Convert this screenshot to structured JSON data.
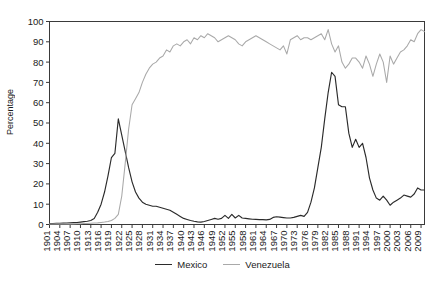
{
  "chart_data": {
    "type": "line",
    "title": "",
    "xlabel": "",
    "ylabel": "Percentage",
    "ylim": [
      0,
      100
    ],
    "yticks": [
      0,
      10,
      20,
      30,
      40,
      50,
      60,
      70,
      80,
      90,
      100
    ],
    "xlim": [
      1901,
      2010
    ],
    "xtick_labels": [
      "1901",
      "1904",
      "1907",
      "1910",
      "1913",
      "1916",
      "1919",
      "1922",
      "1925",
      "1928",
      "1931",
      "1934",
      "1937",
      "1940",
      "1943",
      "1946",
      "1949",
      "1952",
      "1955",
      "1958",
      "1961",
      "1964",
      "1967",
      "1970",
      "1973",
      "1976",
      "1979",
      "1982",
      "1985",
      "1988",
      "1991",
      "1994",
      "1997",
      "2000",
      "2003",
      "2006",
      "2009"
    ],
    "grid": false,
    "legend_position": "bottom-center",
    "x": [
      1901,
      1902,
      1903,
      1904,
      1905,
      1906,
      1907,
      1908,
      1909,
      1910,
      1911,
      1912,
      1913,
      1914,
      1915,
      1916,
      1917,
      1918,
      1919,
      1920,
      1921,
      1922,
      1923,
      1924,
      1925,
      1926,
      1927,
      1928,
      1929,
      1930,
      1931,
      1932,
      1933,
      1934,
      1935,
      1936,
      1937,
      1938,
      1939,
      1940,
      1941,
      1942,
      1943,
      1944,
      1945,
      1946,
      1947,
      1948,
      1949,
      1950,
      1951,
      1952,
      1953,
      1954,
      1955,
      1956,
      1957,
      1958,
      1959,
      1960,
      1961,
      1962,
      1963,
      1964,
      1965,
      1966,
      1967,
      1968,
      1969,
      1970,
      1971,
      1972,
      1973,
      1974,
      1975,
      1976,
      1977,
      1978,
      1979,
      1980,
      1981,
      1982,
      1983,
      1984,
      1985,
      1986,
      1987,
      1988,
      1989,
      1990,
      1991,
      1992,
      1993,
      1994,
      1995,
      1996,
      1997,
      1998,
      1999,
      2000,
      2001,
      2002,
      2003,
      2004,
      2005,
      2006,
      2007,
      2008,
      2009,
      2010
    ],
    "series": [
      {
        "name": "Mexico",
        "color": "#2b2b2b",
        "values": [
          0.5,
          0.5,
          0.6,
          0.6,
          0.7,
          0.7,
          0.8,
          0.9,
          1.0,
          1.2,
          1.4,
          1.6,
          2.0,
          3.0,
          6.0,
          10.0,
          16.0,
          24.0,
          33.0,
          35.0,
          52.0,
          44.0,
          36.0,
          28.0,
          21.0,
          16.0,
          13.0,
          11.0,
          10.0,
          9.5,
          9.0,
          9.0,
          8.5,
          8.0,
          7.5,
          7.0,
          6.0,
          5.0,
          4.0,
          3.0,
          2.5,
          2.0,
          1.6,
          1.3,
          1.2,
          1.5,
          2.0,
          2.5,
          3.0,
          2.6,
          3.0,
          4.5,
          3.0,
          5.0,
          3.2,
          4.5,
          3.2,
          3.0,
          2.8,
          2.6,
          2.5,
          2.4,
          2.4,
          2.3,
          2.5,
          3.5,
          3.8,
          3.6,
          3.4,
          3.2,
          3.2,
          3.5,
          4.0,
          4.5,
          4.0,
          6.0,
          11.0,
          18.0,
          28.0,
          38.0,
          52.0,
          65.0,
          75.0,
          73.0,
          59.0,
          58.0,
          58.0,
          45.0,
          38.0,
          42.0,
          38.0,
          40.0,
          33.0,
          23.0,
          17.0,
          13.0,
          12.0,
          14.0,
          12.0,
          9.5,
          11.0,
          12.0,
          13.0,
          14.5,
          14.0,
          13.5,
          15.0,
          18.0,
          17.0,
          17.0
        ]
      },
      {
        "name": "Venezuela",
        "color": "#a9a9a9",
        "values": [
          0.2,
          0.2,
          0.2,
          0.2,
          0.2,
          0.3,
          0.3,
          0.3,
          0.4,
          0.4,
          0.5,
          0.5,
          0.6,
          0.7,
          0.8,
          1.0,
          1.2,
          1.5,
          2.0,
          3.0,
          5.0,
          14.0,
          30.0,
          47.0,
          59.0,
          62.0,
          65.0,
          70.0,
          74.0,
          77.0,
          79.0,
          80.0,
          82.0,
          83.0,
          86.0,
          85.0,
          88.0,
          89.0,
          88.0,
          90.0,
          91.0,
          89.0,
          92.0,
          91.0,
          93.0,
          92.0,
          94.0,
          93.0,
          92.0,
          90.0,
          91.0,
          92.0,
          93.0,
          92.0,
          91.0,
          89.0,
          88.0,
          90.0,
          91.0,
          92.0,
          93.0,
          92.0,
          91.0,
          90.0,
          89.0,
          88.0,
          87.0,
          86.0,
          88.0,
          84.0,
          91.0,
          92.0,
          93.0,
          91.0,
          92.0,
          92.0,
          91.0,
          92.0,
          93.0,
          94.0,
          91.0,
          96.0,
          89.0,
          85.0,
          88.0,
          80.0,
          77.0,
          79.0,
          82.0,
          82.0,
          80.0,
          77.0,
          83.0,
          79.0,
          73.0,
          79.0,
          84.0,
          80.0,
          70.0,
          83.0,
          79.0,
          82.0,
          85.0,
          86.0,
          88.0,
          91.0,
          90.0,
          94.0,
          96.0,
          95.0
        ]
      }
    ]
  },
  "legend": {
    "entries": [
      {
        "label": "Mexico",
        "color": "#2b2b2b"
      },
      {
        "label": "Venezuela",
        "color": "#a9a9a9"
      }
    ]
  },
  "axes": {
    "ylabel": "Percentage"
  }
}
